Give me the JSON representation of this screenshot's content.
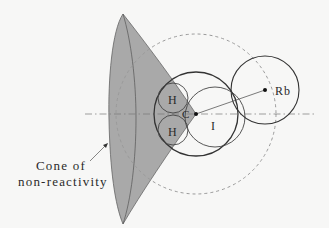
{
  "diagram": {
    "labels": {
      "hydrogen_top": "H",
      "hydrogen_bottom": "H",
      "carbon": "C",
      "iodine": "I",
      "rubidium": "Rb",
      "cone_line1": "Cone of",
      "cone_line2": "non-reactivity"
    },
    "colors": {
      "background": "#f7f7f6",
      "cone_fill": "#a9a9a9",
      "stroke": "#333333",
      "dashed_circle": "#9a9a9a",
      "axis": "#777777"
    }
  }
}
